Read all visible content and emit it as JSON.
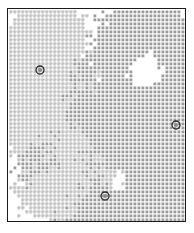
{
  "figure": {
    "kind": "spatial-lattice-distribution",
    "frame": {
      "x": 7,
      "y": 8,
      "width": 179,
      "height": 214,
      "border_color": "#1a1a1a",
      "border_width": 1,
      "background_color": "#ffffff"
    },
    "lattice": {
      "cell_size": 4,
      "columns": 44,
      "rows": 53,
      "origin_x": 1,
      "origin_y": 1
    }
  },
  "legend_colors": {
    "species_a_cross": "#c4c4c4",
    "species_b_square": "#9c9c9c",
    "highlight_ring": "#262626",
    "highlight_fill": "#8c8c8c",
    "frame": "#1a1a1a",
    "background": "#ffffff"
  },
  "chart_data": {
    "type": "heatmap",
    "title": "",
    "subtitle": "",
    "xlabel": "",
    "ylabel": "",
    "grid": false,
    "legend_position": "none",
    "axis_ticks_visible": false,
    "xlim": [
      0,
      44
    ],
    "ylim": [
      0,
      53
    ],
    "series": [
      {
        "name": "species-a",
        "marker": "plus",
        "color": "#c4c4c4",
        "count_approx": 392,
        "density_regions": "upper-left, mid-left, lower-left-to-center"
      },
      {
        "name": "species-b",
        "marker": "square",
        "color": "#9c9c9c",
        "count_approx": 968,
        "density_regions": "upper-right, right, lower-right, lower-center"
      }
    ],
    "highlight_points": [
      {
        "label": "",
        "x_px": 40,
        "y_px": 70,
        "col": 8,
        "row": 15
      },
      {
        "label": "",
        "x_px": 176,
        "y_px": 125,
        "col": 42,
        "row": 29
      },
      {
        "label": "",
        "x_px": 105,
        "y_px": 196,
        "col": 24,
        "row": 47
      }
    ],
    "field_definition": {
      "note": "Occupancy is generated from a smooth two-lobe potential: species B (squares) dominates where the right/lower-right lobe field exceeds threshold; species A (crosses) dominates on the complementary left/upper-left lobe. Values below are the field parameters that reproduce the printed pattern.",
      "species_b_centers": [
        {
          "cx": 0.74,
          "cy": 0.14,
          "sx": 0.26,
          "sy": 0.2,
          "amp": 1.05
        },
        {
          "cx": 0.97,
          "cy": 0.36,
          "sx": 0.22,
          "sy": 0.26,
          "amp": 1.0
        },
        {
          "cx": 0.78,
          "cy": 0.62,
          "sx": 0.3,
          "sy": 0.22,
          "amp": 1.02
        },
        {
          "cx": 0.9,
          "cy": 0.88,
          "sx": 0.26,
          "sy": 0.2,
          "amp": 1.0
        },
        {
          "cx": 0.48,
          "cy": 0.52,
          "sx": 0.2,
          "sy": 0.18,
          "amp": 0.72
        },
        {
          "cx": 0.3,
          "cy": 0.78,
          "sx": 0.26,
          "sy": 0.18,
          "amp": 0.78
        },
        {
          "cx": 0.17,
          "cy": 0.62,
          "sx": 0.16,
          "sy": 0.14,
          "amp": 0.58
        },
        {
          "cx": 0.55,
          "cy": 0.95,
          "sx": 0.24,
          "sy": 0.14,
          "amp": 0.8
        },
        {
          "cx": 0.36,
          "cy": 0.27,
          "sx": 0.13,
          "sy": 0.12,
          "amp": 0.46
        }
      ],
      "species_b_holes": [
        {
          "cx": 0.8,
          "cy": 0.28,
          "r": 0.115,
          "depth": 1.25
        },
        {
          "cx": 0.62,
          "cy": 0.8,
          "r": 0.075,
          "depth": 1.05
        },
        {
          "cx": 0.9,
          "cy": 0.52,
          "r": 0.055,
          "depth": 0.85
        },
        {
          "cx": 0.4,
          "cy": 0.6,
          "r": 0.055,
          "depth": 0.7
        }
      ],
      "species_a_centers": [
        {
          "cx": 0.14,
          "cy": 0.1,
          "sx": 0.17,
          "sy": 0.14,
          "amp": 0.9
        },
        {
          "cx": 0.32,
          "cy": 0.09,
          "sx": 0.14,
          "sy": 0.11,
          "amp": 0.82
        },
        {
          "cx": 0.1,
          "cy": 0.3,
          "sx": 0.15,
          "sy": 0.15,
          "amp": 0.88
        },
        {
          "cx": 0.26,
          "cy": 0.22,
          "sx": 0.14,
          "sy": 0.14,
          "amp": 0.8
        },
        {
          "cx": 0.18,
          "cy": 0.45,
          "sx": 0.16,
          "sy": 0.12,
          "amp": 0.8
        },
        {
          "cx": 0.08,
          "cy": 0.57,
          "sx": 0.12,
          "sy": 0.12,
          "amp": 0.78
        },
        {
          "cx": 0.3,
          "cy": 0.64,
          "sx": 0.17,
          "sy": 0.14,
          "amp": 0.84
        },
        {
          "cx": 0.4,
          "cy": 0.8,
          "sx": 0.2,
          "sy": 0.16,
          "amp": 0.86
        },
        {
          "cx": 0.21,
          "cy": 0.88,
          "sx": 0.18,
          "sy": 0.13,
          "amp": 0.8
        },
        {
          "cx": 0.47,
          "cy": 0.36,
          "sx": 0.12,
          "sy": 0.12,
          "amp": 0.52
        },
        {
          "cx": 0.55,
          "cy": 0.66,
          "sx": 0.1,
          "sy": 0.1,
          "amp": 0.44
        }
      ],
      "threshold_b": 0.42,
      "threshold_a": 0.4,
      "noise_amplitude": 0.21,
      "random_seed": 20240917
    }
  }
}
